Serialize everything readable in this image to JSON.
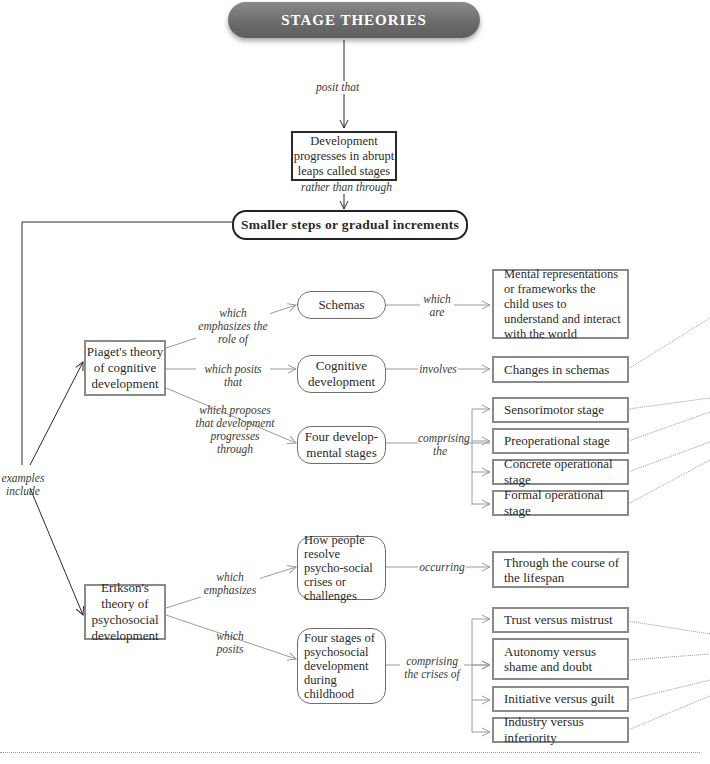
{
  "title": "STAGE THEORIES",
  "nodes": {
    "abrupt": "Development progresses in abrupt leaps called stages",
    "gradual": "Smaller steps or gradual increments",
    "piaget": "Piaget's theory of cognitive development",
    "schemas": "Schemas",
    "mental_reps": "Mental representations or frameworks the child uses to understand and interact with the world",
    "cog_dev": "Cognitive development",
    "changes": "Changes in schemas",
    "four_dev": "Four develop-mental stages",
    "piaget_stages": [
      "Sensorimotor stage",
      "Preoperational stage",
      "Concrete operational stage",
      "Formal operational stage"
    ],
    "erikson": "Erikson's theory of psychosocial development",
    "resolve": "How people resolve psycho-social crises or challenges",
    "lifespan": "Through the course of the lifespan",
    "four_psy": "Four stages of psychosocial development during childhood",
    "erikson_stages": [
      "Trust versus mistrust",
      "Autonomy versus shame and doubt",
      "Initiative versus guilt",
      "Industry versus inferiority"
    ]
  },
  "links": {
    "posit_that": "posit that",
    "rather_than": "rather than through",
    "examples_include": "examples include",
    "emphasizes_role": "which emphasizes the role of",
    "posits_that": "which posits that",
    "proposes": "which proposes that development progresses through",
    "which_are": "which are",
    "involves": "involves",
    "comprising_the": "comprising the",
    "which_emphasizes": "which emphasizes",
    "which_posits": "which posits",
    "occurring": "occurring",
    "comprising_crises": "comprising the crises of"
  },
  "colors": {
    "title_fill": "#6e6e6e",
    "dark_line": "#2a2a2a",
    "light_line": "#9a9a9a"
  }
}
